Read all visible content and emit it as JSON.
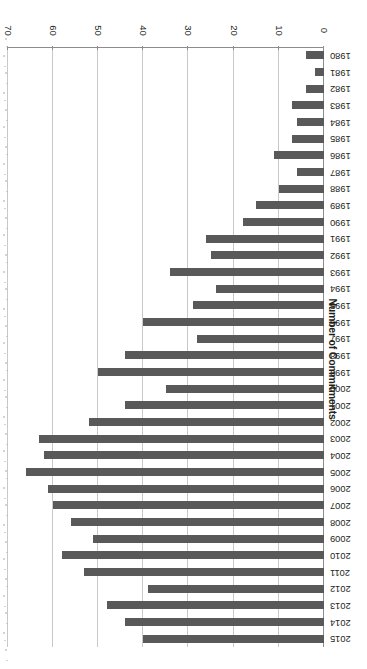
{
  "chart_data": {
    "type": "bar",
    "orientation": "horizontal",
    "title": "",
    "xlabel": "Number of Commitments",
    "ylabel": "",
    "xlim": [
      0,
      70
    ],
    "xticks": [
      0,
      10,
      20,
      30,
      40,
      50,
      60,
      70
    ],
    "grid": true,
    "legend": "none",
    "bar_color": "#595959",
    "grid_color": "#c9c9c9",
    "axis_color": "#8d8d8d",
    "categories": [
      "1980",
      "1981",
      "1982",
      "1983",
      "1984",
      "1985",
      "1986",
      "1987",
      "1988",
      "1989",
      "1990",
      "1991",
      "1992",
      "1993",
      "1994",
      "1995",
      "1996",
      "1997",
      "1998",
      "1999",
      "2000",
      "2001",
      "2002",
      "2003",
      "2004",
      "2005",
      "2006",
      "2007",
      "2008",
      "2009",
      "2010",
      "2011",
      "2012",
      "2013",
      "2014",
      "2015"
    ],
    "values": [
      4,
      2,
      4,
      7,
      6,
      7,
      11,
      6,
      10,
      15,
      18,
      26,
      25,
      34,
      24,
      29,
      40,
      28,
      44,
      50,
      35,
      44,
      52,
      63,
      62,
      66,
      61,
      60,
      56,
      51,
      58,
      53,
      39,
      48,
      44,
      40
    ]
  },
  "figure": {
    "rotation_degrees": 180,
    "axis_title": "Number of Commitments"
  }
}
